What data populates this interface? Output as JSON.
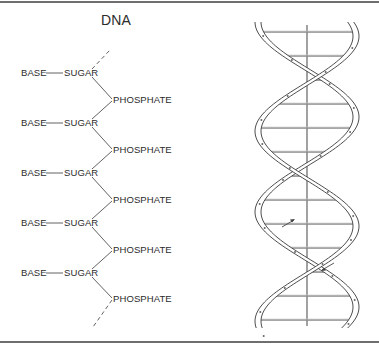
{
  "figure": {
    "title": "DNA",
    "backbone": {
      "units": [
        {
          "base": "BASE",
          "sugar": "SUGAR",
          "phosphate": "PHOSPHATE"
        },
        {
          "base": "BASE",
          "sugar": "SUGAR",
          "phosphate": "PHOSPHATE"
        },
        {
          "base": "BASE",
          "sugar": "SUGAR",
          "phosphate": "PHOSPHATE"
        },
        {
          "base": "BASE",
          "sugar": "SUGAR",
          "phosphate": "PHOSPHATE"
        },
        {
          "base": "BASE",
          "sugar": "SUGAR",
          "phosphate": "PHOSPHATE"
        }
      ],
      "row_y": [
        73,
        123,
        173,
        223,
        273
      ],
      "phosphate_y": [
        100,
        150,
        200,
        250,
        299
      ]
    },
    "helix": {
      "description": "double helix with horizontal base-pair rungs around a central axis",
      "axis_x": 307,
      "top": 22,
      "bottom": 328,
      "left": 258,
      "right": 356,
      "arrows": [
        {
          "direction": "up",
          "x": 290,
          "y": 222
        },
        {
          "direction": "down",
          "x": 326,
          "y": 268
        }
      ]
    },
    "colors": {
      "line": "#3a3a3a",
      "rung": "#8a8a8a",
      "rule": "#6e6e6e",
      "text": "#2b2b2b"
    }
  }
}
